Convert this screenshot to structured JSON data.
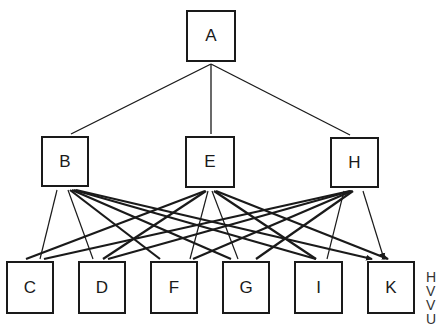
{
  "diagram": {
    "type": "hierarchy-graph",
    "stroke_color": "#1a1a1a",
    "nodes": [
      {
        "id": "A",
        "label": "A",
        "x": 186,
        "y": 10,
        "w": 50,
        "h": 52
      },
      {
        "id": "B",
        "label": "B",
        "x": 41,
        "y": 136,
        "w": 48,
        "h": 51
      },
      {
        "id": "E",
        "label": "E",
        "x": 185,
        "y": 136,
        "w": 50,
        "h": 52
      },
      {
        "id": "H",
        "label": "H",
        "x": 330,
        "y": 137,
        "w": 49,
        "h": 51
      },
      {
        "id": "C",
        "label": "C",
        "x": 6,
        "y": 261,
        "w": 48,
        "h": 53
      },
      {
        "id": "D",
        "label": "D",
        "x": 78,
        "y": 261,
        "w": 48,
        "h": 53
      },
      {
        "id": "F",
        "label": "F",
        "x": 150,
        "y": 261,
        "w": 48,
        "h": 53
      },
      {
        "id": "G",
        "label": "G",
        "x": 222,
        "y": 261,
        "w": 48,
        "h": 53
      },
      {
        "id": "I",
        "label": "I",
        "x": 294,
        "y": 261,
        "w": 49,
        "h": 53
      },
      {
        "id": "K",
        "label": "K",
        "x": 367,
        "y": 261,
        "w": 48,
        "h": 53
      }
    ],
    "tree_edges": [
      {
        "from": "A",
        "to": "B",
        "x1": 211,
        "y1": 64,
        "x2": 71,
        "y2": 134
      },
      {
        "from": "A",
        "to": "E",
        "x1": 211,
        "y1": 64,
        "x2": 211,
        "y2": 134
      },
      {
        "from": "A",
        "to": "H",
        "x1": 211,
        "y1": 64,
        "x2": 350,
        "y2": 135
      }
    ],
    "cross_edges": [
      {
        "from": "B",
        "to": "C",
        "x1": 57,
        "y1": 190,
        "x2": 40,
        "y2": 259,
        "w": 1.2
      },
      {
        "from": "B",
        "to": "D",
        "x1": 68,
        "y1": 190,
        "x2": 93,
        "y2": 259,
        "w": 1.2
      },
      {
        "from": "B",
        "to": "F",
        "x1": 70,
        "y1": 190,
        "x2": 160,
        "y2": 259,
        "w": 2.2
      },
      {
        "from": "B",
        "to": "G",
        "x1": 72,
        "y1": 190,
        "x2": 231,
        "y2": 259,
        "w": 2.2
      },
      {
        "from": "B",
        "to": "I",
        "x1": 74,
        "y1": 190,
        "x2": 316,
        "y2": 259,
        "w": 2.2
      },
      {
        "from": "B",
        "to": "K",
        "x1": 76,
        "y1": 190,
        "x2": 372,
        "y2": 259,
        "w": 2.2
      },
      {
        "from": "E",
        "to": "C",
        "x1": 205,
        "y1": 191,
        "x2": 26,
        "y2": 259,
        "w": 2.2
      },
      {
        "from": "E",
        "to": "D",
        "x1": 206,
        "y1": 191,
        "x2": 103,
        "y2": 259,
        "w": 2.2
      },
      {
        "from": "E",
        "to": "F",
        "x1": 208,
        "y1": 191,
        "x2": 190,
        "y2": 259,
        "w": 1.2
      },
      {
        "from": "E",
        "to": "G",
        "x1": 212,
        "y1": 191,
        "x2": 238,
        "y2": 259,
        "w": 1.2
      },
      {
        "from": "E",
        "to": "I",
        "x1": 214,
        "y1": 191,
        "x2": 316,
        "y2": 259,
        "w": 2.2
      },
      {
        "from": "E",
        "to": "K",
        "x1": 216,
        "y1": 191,
        "x2": 388,
        "y2": 259,
        "w": 2.2
      },
      {
        "from": "H",
        "to": "C",
        "x1": 350,
        "y1": 191,
        "x2": 44,
        "y2": 259,
        "w": 2.2
      },
      {
        "from": "H",
        "to": "D",
        "x1": 351,
        "y1": 191,
        "x2": 108,
        "y2": 259,
        "w": 2.2
      },
      {
        "from": "H",
        "to": "F",
        "x1": 352,
        "y1": 191,
        "x2": 193,
        "y2": 259,
        "w": 2.2
      },
      {
        "from": "H",
        "to": "G",
        "x1": 353,
        "y1": 191,
        "x2": 256,
        "y2": 259,
        "w": 2.2
      },
      {
        "from": "H",
        "to": "I",
        "x1": 344,
        "y1": 191,
        "x2": 327,
        "y2": 259,
        "w": 1.2
      },
      {
        "from": "H",
        "to": "K",
        "x1": 363,
        "y1": 191,
        "x2": 384,
        "y2": 259,
        "w": 1.2
      }
    ]
  },
  "side_text": {
    "lines": [
      "H",
      "V",
      "V",
      "U"
    ]
  }
}
